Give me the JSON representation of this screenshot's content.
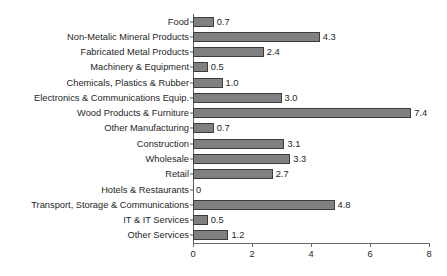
{
  "chart_data": {
    "type": "bar",
    "orientation": "horizontal",
    "title": "",
    "subtitle": "",
    "xlabel": "",
    "ylabel": "",
    "xlim": [
      0,
      8
    ],
    "xticks": [
      "0",
      "2",
      "4",
      "6",
      "8"
    ],
    "xtick_values": [
      0,
      2,
      4,
      6,
      8
    ],
    "grid": false,
    "legend": null,
    "categories": [
      "Food",
      "Non-Metalic Mineral Products",
      "Fabricated Metal Products",
      "Machinery & Equipment",
      "Chemicals, Plastics & Rubber",
      "Electronics & Communications Equip.",
      "Wood Products & Furniture",
      "Other Manufacturing",
      "Construction",
      "Wholesale",
      "Retail",
      "Hotels & Restaurants",
      "Transport, Storage & Communications",
      "IT & IT Services",
      "Other Services"
    ],
    "values": [
      0.7,
      4.3,
      2.4,
      0.5,
      1.0,
      3.0,
      7.4,
      0.7,
      3.1,
      3.3,
      2.7,
      0,
      4.8,
      0.5,
      1.2
    ],
    "value_labels": [
      "0.7",
      "4.3",
      "2.4",
      "0.5",
      "1.0",
      "3.0",
      "7.4",
      "0.7",
      "3.1",
      "3.3",
      "2.7",
      "0",
      "4.8",
      "0.5",
      "1.2"
    ],
    "colors": {
      "bar_fill": "#808080",
      "bar_border": "#3d3d3d",
      "axis": "#5c5c5c",
      "text": "#262626",
      "background": "#ffffff"
    }
  }
}
